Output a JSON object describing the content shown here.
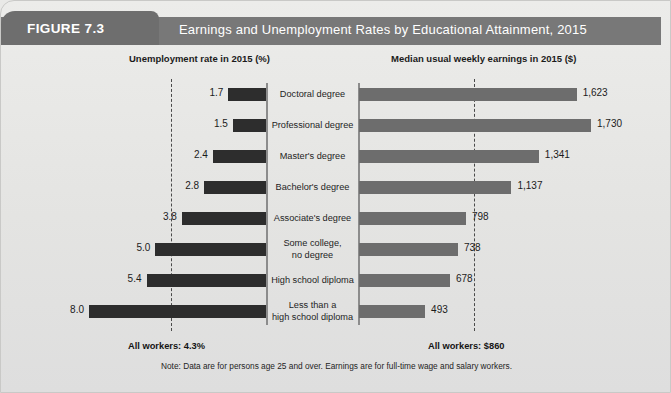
{
  "figure": {
    "tag": "FIGURE 7.3",
    "title": "Earnings and Unemployment Rates by Educational Attainment, 2015"
  },
  "headings": {
    "left": "Unemployment rate in 2015 (%)",
    "right": "Median usual weekly earnings in 2015 ($)"
  },
  "footers": {
    "left_all_workers": "All workers: 4.3%",
    "right_all_workers": "All workers: $860",
    "note": "Note: Data are for persons age 25 and over. Earnings are for full-time wage and salary workers."
  },
  "chart_data": {
    "type": "bar",
    "title": "Earnings and Unemployment Rates by Educational Attainment, 2015",
    "orientation": "horizontal",
    "layout": "back-to-back (diverging) paired bars with centered category labels",
    "categories": [
      "Doctoral degree",
      "Professional degree",
      "Master's degree",
      "Bachelor's degree",
      "Associate's degree",
      "Some college,\nno degree",
      "High school diploma",
      "Less than a\nhigh school diploma"
    ],
    "category_lines": [
      [
        "Doctoral degree"
      ],
      [
        "Professional degree"
      ],
      [
        "Master's degree"
      ],
      [
        "Bachelor's degree"
      ],
      [
        "Associate's degree"
      ],
      [
        "Some college,",
        "no degree"
      ],
      [
        "High school diploma"
      ],
      [
        "Less than a",
        "high school diploma"
      ]
    ],
    "series": [
      {
        "name": "Unemployment rate in 2015 (%)",
        "side": "left",
        "direction": "right-to-left",
        "unit": "%",
        "color": "#2d2d2d",
        "values": [
          1.7,
          1.5,
          2.4,
          2.8,
          3.8,
          5.0,
          5.4,
          8.0
        ],
        "labels": [
          "1.7",
          "1.5",
          "2.4",
          "2.8",
          "3.8",
          "5.0",
          "5.4",
          "8.0"
        ],
        "axis_max": 8.0,
        "reference_line": {
          "value": 4.3,
          "label": "All workers: 4.3%",
          "style": "dashed"
        }
      },
      {
        "name": "Median usual weekly earnings in 2015 ($)",
        "side": "right",
        "direction": "left-to-right",
        "unit": "$",
        "color": "#6d6d6d",
        "values": [
          1623,
          1730,
          1341,
          1137,
          798,
          738,
          678,
          493
        ],
        "labels": [
          "1,623",
          "1,730",
          "1,341",
          "1,137",
          "798",
          "738",
          "678",
          "493"
        ],
        "axis_max": 1730,
        "reference_line": {
          "value": 860,
          "label": "All workers: $860",
          "style": "dashed"
        }
      }
    ],
    "grid": false,
    "legend": "none",
    "note": "Note: Data are for persons age 25 and over. Earnings are for full-time wage and salary workers."
  }
}
